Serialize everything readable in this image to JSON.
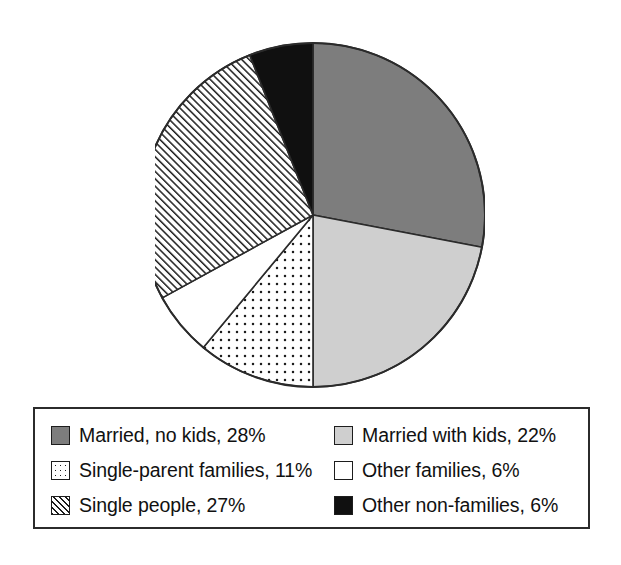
{
  "chart_data": {
    "type": "pie",
    "title": "",
    "subtitle": "",
    "xlabel": "",
    "ylabel": "",
    "grid": false,
    "legend_position": "bottom",
    "start_angle_deg": 0,
    "direction": "clockwise",
    "units": "percent",
    "categories": [
      "Married, no kids",
      "Married with kids",
      "Single-parent families",
      "Other families",
      "Single people",
      "Other non-families"
    ],
    "values": [
      28,
      22,
      11,
      6,
      27,
      6
    ],
    "value_labels": [
      "28%",
      "22%",
      "11%",
      "6%",
      "27%",
      "6%"
    ],
    "slices": [
      {
        "label": "Married, no kids",
        "value": 28,
        "value_label": "28%",
        "legend_text": "Married, no kids, 28%",
        "fill": "solid-dark-gray",
        "color": "#7d7d7d",
        "start_deg": 0.0,
        "end_deg": 100.8
      },
      {
        "label": "Married with kids",
        "value": 22,
        "value_label": "22%",
        "legend_text": "Married with kids, 22%",
        "fill": "solid-light-gray",
        "color": "#cfcfcf",
        "start_deg": 100.8,
        "end_deg": 180.0
      },
      {
        "label": "Single-parent families",
        "value": 11,
        "value_label": "11%",
        "legend_text": "Single-parent families, 11%",
        "fill": "dotted",
        "color": "#ffffff",
        "start_deg": 180.0,
        "end_deg": 219.6
      },
      {
        "label": "Other families",
        "value": 6,
        "value_label": "6%",
        "legend_text": "Other families, 6%",
        "fill": "solid-white",
        "color": "#ffffff",
        "start_deg": 219.6,
        "end_deg": 241.2
      },
      {
        "label": "Single people",
        "value": 27,
        "value_label": "27%",
        "legend_text": "Single people, 27%",
        "fill": "diagonal-hatch",
        "color": "#ffffff",
        "start_deg": 241.2,
        "end_deg": 338.4
      },
      {
        "label": "Other non-families",
        "value": 6,
        "value_label": "6%",
        "legend_text": "Other non-families, 6%",
        "fill": "solid-black",
        "color": "#101010",
        "start_deg": 338.4,
        "end_deg": 360.0
      }
    ]
  },
  "legend": {
    "column_left": [
      {
        "text": "Married, no kids, 28%",
        "swatch": "solid-dark-gray"
      },
      {
        "text": "Single-parent families, 11%",
        "swatch": "dotted"
      },
      {
        "text": "Single people, 27%",
        "swatch": "diagonal-hatch"
      }
    ],
    "column_right": [
      {
        "text": "Married with kids, 22%",
        "swatch": "solid-light-gray"
      },
      {
        "text": "Other families, 6%",
        "swatch": "solid-white"
      },
      {
        "text": "Other non-families, 6%",
        "swatch": "solid-black"
      }
    ]
  },
  "colors": {
    "dark_gray": "#7d7d7d",
    "light_gray": "#cfcfcf",
    "black": "#101010",
    "white": "#ffffff",
    "outline": "#2b2b2b",
    "text": "#111111"
  }
}
